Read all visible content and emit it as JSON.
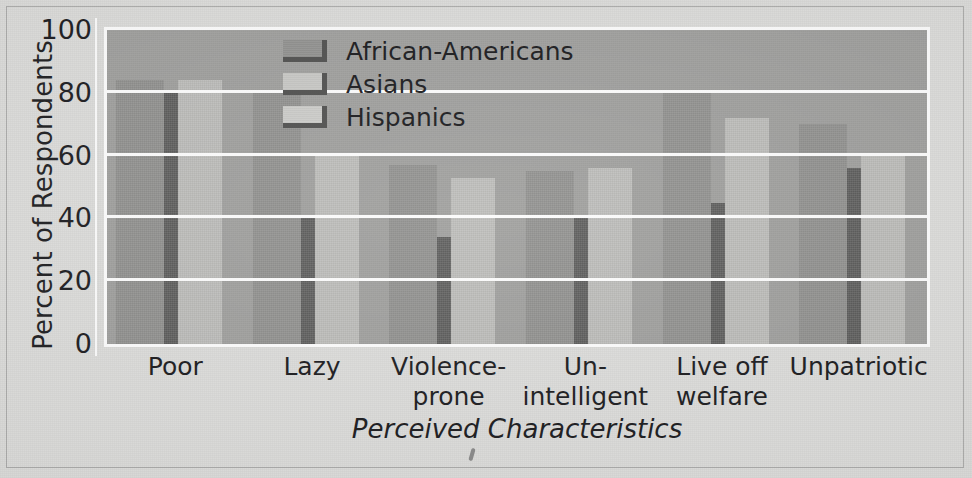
{
  "chart_data": {
    "type": "bar",
    "title": "",
    "xlabel": "Perceived Characteristics",
    "ylabel": "Percent of Respondents",
    "ylim": [
      0,
      100
    ],
    "yticks": [
      0,
      20,
      40,
      60,
      80,
      100
    ],
    "grid": true,
    "legend_position": "top-center",
    "categories": [
      "Poor",
      "Violence-prone",
      "Un-intelligent",
      "Live off welfare",
      "Unpatriotic",
      "Lazy"
    ],
    "category_labels": [
      [
        "Poor",
        ""
      ],
      [
        "Lazy",
        ""
      ],
      [
        "Violence-",
        "prone"
      ],
      [
        "Un-",
        "intelligent"
      ],
      [
        "Live off",
        "welfare"
      ],
      [
        "Unpatriotic",
        ""
      ]
    ],
    "category_order": [
      "Poor",
      "Lazy",
      "Violence-prone",
      "Un-intelligent",
      "Live off welfare",
      "Unpatriotic"
    ],
    "series": [
      {
        "name": "African-Americans",
        "color": "#8f8f8d",
        "values": [
          84,
          80,
          57,
          55,
          80,
          70
        ]
      },
      {
        "name": "Asians",
        "color": "#5b5b5a",
        "values": [
          80,
          40,
          34,
          41,
          45,
          56
        ]
      },
      {
        "name": "Hispanics",
        "color": "#b9b9b6",
        "values": [
          84,
          60,
          53,
          56,
          72,
          60
        ]
      }
    ]
  },
  "axes": {
    "y_title": "Percent of Respondents",
    "x_title": "Perceived Characteristics",
    "y_tick_labels": [
      "100",
      "80",
      "60",
      "40",
      "20",
      "0"
    ]
  },
  "legend": {
    "entries": [
      {
        "label": "African-Americans",
        "swatch": "legend-swatch-african-americans"
      },
      {
        "label": "Asians",
        "swatch": "legend-swatch-asians"
      },
      {
        "label": "Hispanics",
        "swatch": "legend-swatch-hispanics"
      }
    ]
  },
  "colors": {
    "plot_background": "#9d9d9b",
    "page_background": "#dcdcda",
    "gridline": "#fbfbfb",
    "text": "#141417",
    "series_african_americans": "#8f8f8d",
    "series_asians": "#5b5b5a",
    "series_hispanics": "#b9b9b6"
  }
}
